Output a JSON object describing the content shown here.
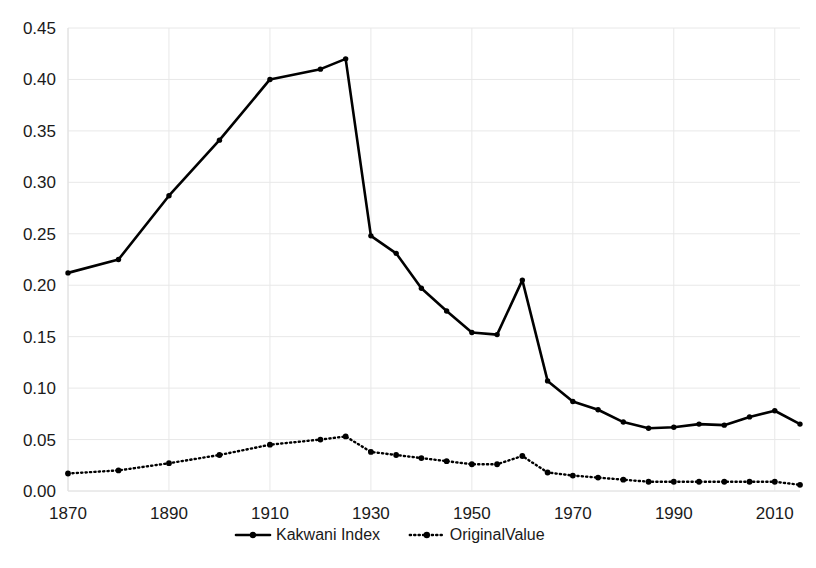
{
  "chart_data": {
    "type": "line",
    "title": "",
    "xlabel": "",
    "ylabel": "",
    "xlim": [
      1870,
      2015
    ],
    "ylim": [
      0.0,
      0.45
    ],
    "xticks": [
      1870,
      1890,
      1910,
      1930,
      1950,
      1970,
      1990,
      2010
    ],
    "xtick_labels": [
      "1870",
      "1890",
      "1910",
      "1930",
      "1950",
      "1970",
      "1990",
      "2010"
    ],
    "yticks": [
      0.0,
      0.05,
      0.1,
      0.15,
      0.2,
      0.25,
      0.3,
      0.35,
      0.4,
      0.45
    ],
    "ytick_labels": [
      "0.00",
      "0.05",
      "0.10",
      "0.15",
      "0.20",
      "0.25",
      "0.30",
      "0.35",
      "0.40",
      "0.45"
    ],
    "grid": true,
    "legend_position": "bottom",
    "x": [
      1870,
      1880,
      1890,
      1900,
      1910,
      1920,
      1925,
      1930,
      1935,
      1940,
      1945,
      1950,
      1955,
      1960,
      1965,
      1970,
      1975,
      1980,
      1985,
      1990,
      1995,
      2000,
      2005,
      2010,
      2015
    ],
    "series": [
      {
        "name": "Kakwani Index",
        "style": "solid",
        "color": "#000000",
        "values": [
          0.212,
          0.225,
          0.287,
          0.341,
          0.4,
          0.41,
          0.42,
          0.248,
          0.231,
          0.197,
          0.175,
          0.154,
          0.152,
          0.205,
          0.107,
          0.087,
          0.079,
          0.067,
          0.061,
          0.062,
          0.065,
          0.064,
          0.072,
          0.078,
          0.065
        ]
      },
      {
        "name": "OriginalValue",
        "style": "dotted",
        "color": "#000000",
        "values": [
          0.017,
          0.02,
          0.027,
          0.035,
          0.045,
          0.05,
          0.053,
          0.038,
          0.035,
          0.032,
          0.029,
          0.026,
          0.026,
          0.034,
          0.018,
          0.015,
          0.013,
          0.011,
          0.009,
          0.009,
          0.009,
          0.009,
          0.009,
          0.009,
          0.006
        ]
      }
    ]
  },
  "legend": {
    "items": [
      {
        "label": "Kakwani Index",
        "style": "solid"
      },
      {
        "label": "OriginalValue",
        "style": "dotted"
      }
    ]
  }
}
